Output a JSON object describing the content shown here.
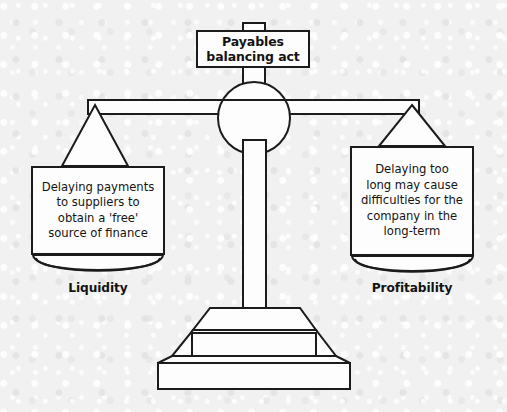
{
  "figure": {
    "kind": "balance-scale-diagram",
    "title": "Payables balancing act",
    "background_color": "#f1f1f1",
    "line_color": "#1b1b1b",
    "fill_color": "#fdfdfd"
  },
  "title_box": {
    "line1": "Payables",
    "line2": "balancing act",
    "text": "Payables balancing act"
  },
  "left_pan": {
    "box_text": "Delaying payments to suppliers to obtain a 'free' source of finance",
    "lines": [
      "Delaying payments",
      "to suppliers to",
      "obtain a 'free'",
      "source of finance"
    ],
    "label": "Liquidity"
  },
  "right_pan": {
    "box_text": "Delaying too long may cause difficulties for the company in the long-term",
    "lines": [
      "Delaying too",
      "long may cause",
      "difficulties for the",
      "company in the",
      "long-term"
    ],
    "label": "Profitability"
  },
  "parts": {
    "fulcrum": "pivot-circle",
    "beam": "horizontal-beam",
    "column": "vertical-post",
    "base": "stepped-plinth",
    "left_hanger": "triangle-hanger-left",
    "right_hanger": "triangle-hanger-right",
    "left_dish": "pan-dish-left",
    "right_dish": "pan-dish-right"
  }
}
